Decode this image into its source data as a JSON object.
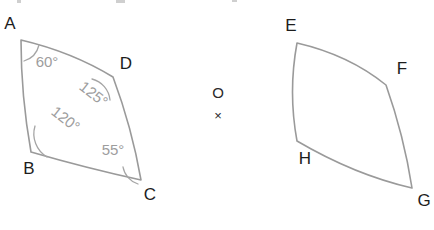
{
  "canvas": {
    "width": 434,
    "height": 230,
    "background": "#ffffff",
    "stroke_color": "#9a9a9a",
    "label_color": "#1d1d1d",
    "angle_label_color": "#9d9d9d"
  },
  "figures": {
    "left": {
      "name": "curved-quadrilateral-abdc",
      "vertices": [
        {
          "id": "A",
          "label": "A",
          "x": 21,
          "y": 40,
          "label_x": 10,
          "label_y": 25
        },
        {
          "id": "D",
          "label": "D",
          "x": 113,
          "y": 77,
          "label_x": 126,
          "label_y": 65
        },
        {
          "id": "C",
          "label": "C",
          "x": 141,
          "y": 180,
          "label_x": 150,
          "label_y": 196
        },
        {
          "id": "B",
          "label": "B",
          "x": 31,
          "y": 152,
          "label_x": 29,
          "label_y": 170
        }
      ],
      "angles": [
        {
          "at": "A",
          "value": "60°",
          "label_x": 47,
          "label_y": 63,
          "rotation": 0
        },
        {
          "at": "D",
          "value": "125°",
          "label_x": 93,
          "label_y": 95,
          "rotation": 38
        },
        {
          "at": "B",
          "value": "120°",
          "label_x": 65,
          "label_y": 120,
          "rotation": 38
        },
        {
          "at": "C",
          "value": "55°",
          "label_x": 113,
          "label_y": 151,
          "rotation": 0
        }
      ],
      "outline_path": "M 21 40 Q 72 52 113 77 Q 132 128 141 180 Q 86 168 31 152 Q 21 96 21 40 Z",
      "angle_arcs": [
        "M 24 61 A 22 22 0 0 0 39 45",
        "M 92 79 A 24 24 0 0 1 110 100",
        "M 35 126 A 27 27 0 0 0 47 157",
        "M 123 167 A 22 22 0 0 0 138 184"
      ]
    },
    "right": {
      "name": "curved-quadrilateral-efgh",
      "vertices": [
        {
          "id": "E",
          "label": "E",
          "x": 297,
          "y": 43,
          "label_x": 291,
          "label_y": 27
        },
        {
          "id": "F",
          "label": "F",
          "x": 386,
          "y": 85,
          "label_x": 402,
          "label_y": 70
        },
        {
          "id": "G",
          "label": "G",
          "x": 412,
          "y": 188,
          "label_x": 424,
          "label_y": 202
        },
        {
          "id": "H",
          "label": "H",
          "x": 297,
          "y": 141,
          "label_x": 305,
          "label_y": 160
        }
      ],
      "outline_path": "M 297 43 Q 349 55 386 85 Q 404 136 412 188 Q 355 175 297 141 Q 288 92 297 43 Z"
    }
  },
  "middle_marks": {
    "name": "center-markers",
    "circle_mark": "O",
    "cross_mark": "×",
    "circle_x": 218,
    "circle_y": 94,
    "cross_x": 218,
    "cross_y": 117
  }
}
